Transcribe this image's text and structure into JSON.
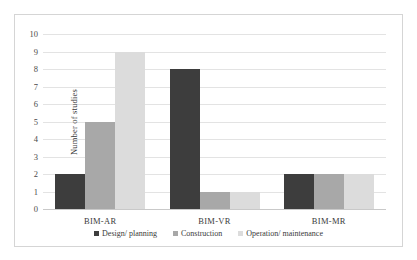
{
  "chart_data": {
    "type": "bar",
    "title": "",
    "xlabel": "",
    "ylabel": "Number of studies",
    "ylim": [
      0,
      10
    ],
    "ytick_step": 1,
    "yticks": [
      "10",
      "9",
      "8",
      "7",
      "6",
      "5",
      "4",
      "3",
      "2",
      "1",
      "0"
    ],
    "grid": true,
    "legend_position": "bottom",
    "categories": [
      "BIM-AR",
      "BIM-VR",
      "BIM-MR"
    ],
    "series": [
      {
        "name": "Design/ planning",
        "values": [
          2,
          8,
          2
        ],
        "color": "#3d3d3d"
      },
      {
        "name": "Construction",
        "values": [
          5,
          1,
          2
        ],
        "color": "#a8a8a8"
      },
      {
        "name": "Operation/ maintenance",
        "values": [
          9,
          1,
          2
        ],
        "color": "#dcdcdc"
      }
    ]
  },
  "colors": {
    "gridline": "#e3e3e3",
    "axis": "#c9c9c9",
    "frame": "#d5d5d5",
    "text": "#3a3a3a",
    "background": "#ffffff"
  }
}
